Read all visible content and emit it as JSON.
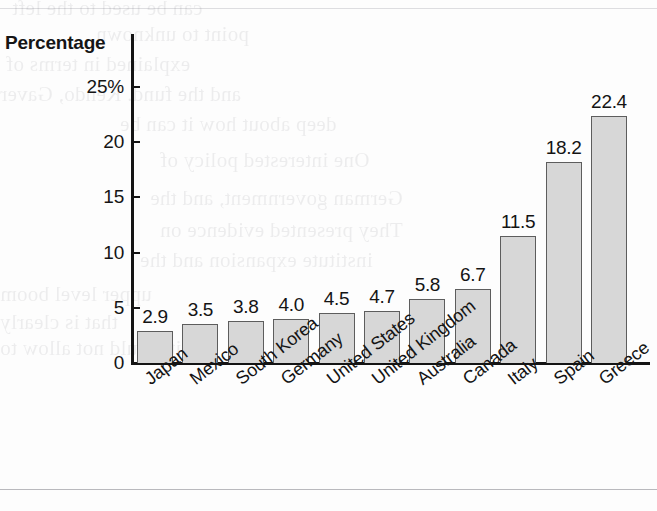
{
  "chart_data": {
    "type": "bar",
    "title": "",
    "ylabel": "Percentage",
    "xlabel": "",
    "categories": [
      "Japan",
      "Mexico",
      "South Korea",
      "Germany",
      "United States",
      "United Kingdom",
      "Australia",
      "Canada",
      "Italy",
      "Spain",
      "Greece"
    ],
    "values": [
      2.9,
      3.5,
      3.8,
      4.0,
      4.5,
      4.7,
      5.8,
      6.7,
      11.5,
      18.2,
      22.4
    ],
    "value_labels": [
      "2.9",
      "3.5",
      "3.8",
      "4.0",
      "4.5",
      "4.7",
      "5.8",
      "6.7",
      "11.5",
      "18.2",
      "22.4"
    ],
    "ylim": [
      0,
      25
    ],
    "ytick_values": [
      0,
      5,
      10,
      15,
      20,
      25
    ],
    "ytick_labels": [
      "0",
      "5",
      "10",
      "15",
      "20",
      "25%"
    ],
    "grid": false,
    "legend": null,
    "bar_fill_color": "#d7d7d7",
    "bar_border_color": "#5d5d5d",
    "axis_color": "#141414",
    "background_color": "#fdfdfd"
  },
  "page_artifacts": {
    "bleed_through_text": [
      "can be used to the left",
      "point to unknown",
      "explained in terms of",
      "and the fund. Kendo, Gaver",
      "deep about how it can be",
      "One interested policy of",
      "German government, and the",
      "They presented evidence on",
      "institute expansion and the",
      "upper level boom",
      "that is clearly",
      "it would not allow to"
    ]
  }
}
